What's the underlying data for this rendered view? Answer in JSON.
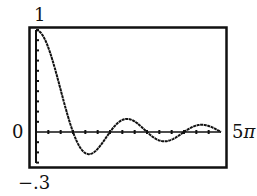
{
  "chart_data": {
    "type": "line",
    "title": "",
    "xlabel": "",
    "ylabel": "",
    "function": "sin(x)/x",
    "xlim": [
      0,
      "5π"
    ],
    "ylim": [
      -0.3,
      1
    ],
    "tick_labels": {
      "y_max": "1",
      "y_zero": "0",
      "y_min": "−.3",
      "x_max": "5π"
    },
    "x_tick_spacing": "π/3",
    "y_tick_spacing": 0.1,
    "grid": false,
    "legend": null,
    "series": [
      {
        "name": "f(x)",
        "x": [
          0,
          1.57,
          3.14,
          4.49,
          6.28,
          7.73,
          9.42,
          10.9,
          12.57,
          14.07,
          15.71
        ],
        "values": [
          1.0,
          0.64,
          0.0,
          -0.22,
          0.0,
          0.13,
          0.0,
          -0.09,
          0.0,
          0.07,
          0.0
        ]
      }
    ]
  },
  "labels": {
    "y_max": "1",
    "y_zero": "0",
    "y_min": "−.3",
    "x_max_num": "5",
    "x_max_sym": "π"
  },
  "colors": {
    "line": "#111111",
    "frame": "#111111",
    "background": "#ffffff"
  }
}
